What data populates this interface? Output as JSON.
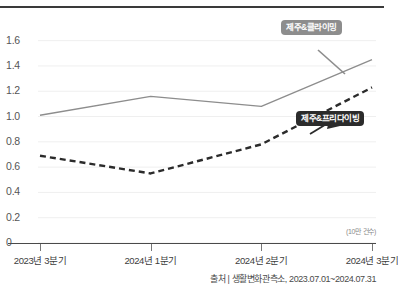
{
  "chart_data": {
    "type": "line",
    "title": "",
    "xlabel": "",
    "ylabel": "",
    "unit_note": "(10만 건수)",
    "categories": [
      "2023년 3분기",
      "2024년 1분기",
      "2024년 2분기",
      "2024년 3분기"
    ],
    "ylim": [
      0,
      1.7
    ],
    "yticks": [
      "1.6",
      "1.4",
      "1.2",
      "1.0",
      "0.8",
      "0.6",
      "0.4",
      "0.2",
      "0"
    ],
    "ytick_values": [
      1.6,
      1.4,
      1.2,
      1.0,
      0.8,
      0.6,
      0.4,
      0.2,
      0
    ],
    "grid": true,
    "legend_position": "inline-callout",
    "series": [
      {
        "name": "제주&클라이밍",
        "style": "solid",
        "color": "#8d8d8d",
        "values": [
          1.01,
          1.16,
          1.08,
          1.45
        ]
      },
      {
        "name": "제주&프리다이빙",
        "style": "dashed",
        "color": "#2b2b2b",
        "values": [
          0.69,
          0.55,
          0.78,
          1.23
        ]
      }
    ]
  },
  "callouts": {
    "climbing_label": "제주&클라이밍",
    "freediving_label": "제주&프리다이빙"
  },
  "footer": {
    "source": "출처 | 생활변화관측소, 2023.07.01~2024.07.31"
  }
}
